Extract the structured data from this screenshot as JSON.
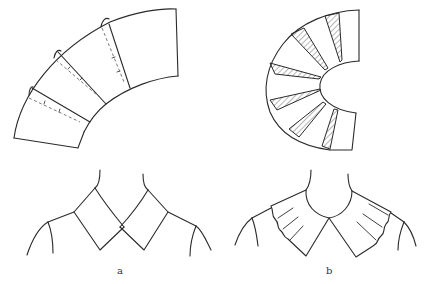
{
  "figure": {
    "panels": [
      {
        "id": "a",
        "label": "a",
        "pattern": "slashed-and-overlapped flat collar pattern, 4 sections along a curved arc with dashed fold lines",
        "garment": "flat collar with pointed ends crossing at center front"
      },
      {
        "id": "b",
        "label": "b",
        "pattern": "slashed-and-spread collar pattern fanned into a half-circle with 6 hatched wedge inserts",
        "garment": "ruffled/fluted collar with round neckline"
      }
    ],
    "colors": {
      "line": "#2a2a2a",
      "dash": "#555555",
      "background": "#ffffff"
    }
  }
}
